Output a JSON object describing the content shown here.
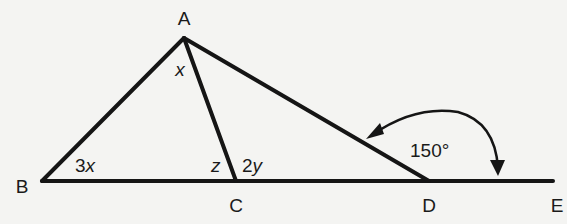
{
  "diagram": {
    "type": "geometry-triangle",
    "points": {
      "A": "A",
      "B": "B",
      "C": "C",
      "D": "D",
      "E": "E"
    },
    "segments": [
      "AB",
      "AC",
      "AD",
      "BE"
    ],
    "angles": {
      "angle_BAC": {
        "coef": "",
        "var": "x"
      },
      "angle_ABC": {
        "coef": "3",
        "var": "x"
      },
      "angle_ACB": {
        "coef": "",
        "var": "z"
      },
      "angle_ACD": {
        "coef": "2",
        "var": "y"
      },
      "angle_ADE": {
        "value": "150°"
      }
    },
    "colors": {
      "ink": "#151515",
      "paper": "#f4f4f2"
    }
  }
}
